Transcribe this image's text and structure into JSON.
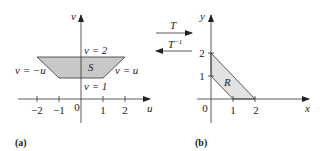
{
  "panel_a": {
    "caption": "(a)",
    "axis_h_label": "u",
    "axis_v_label": "v",
    "origin_label": "0",
    "u_ticks": [
      "−2",
      "−1",
      "1",
      "2"
    ],
    "region_label": "S",
    "boundary_labels": {
      "top": "v = 2",
      "bottom": "v = 1",
      "left": "v = −u",
      "right": "v = u"
    },
    "region_fill": "#c8c8c8"
  },
  "transform": {
    "forward_label": "T",
    "inverse_label": "T",
    "inverse_superscript": "−1"
  },
  "panel_b": {
    "caption": "(b)",
    "axis_h_label": "x",
    "axis_v_label": "y",
    "origin_label": "0",
    "x_ticks": [
      "1",
      "2"
    ],
    "y_ticks": [
      "1",
      "2"
    ],
    "region_label": "R",
    "region_fill": "#e2e2e2"
  }
}
